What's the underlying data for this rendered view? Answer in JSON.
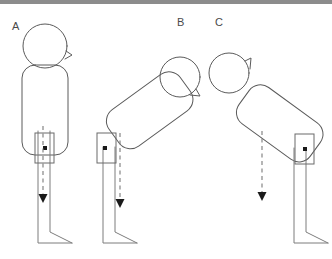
{
  "figure": {
    "background_color": "#ffffff",
    "top_bar_color": "#8c8c8c",
    "outline_color": "#5a5a5a",
    "limb_color": "#7d7d7d",
    "plumb_line_color": "#7a7a7a",
    "marker_color": "#1a1a1a",
    "width": 332,
    "height": 259
  },
  "panels": [
    {
      "id": "A",
      "label": "A",
      "label_x": 12,
      "label_y": 30,
      "description": "Upright standing posture, trunk vertical, plumb line passing through hip marker down to foot",
      "posture": "upright-standing",
      "trunk_angle_deg": 0,
      "plumb_line": {
        "x1": 43,
        "y1": 126,
        "x2": 43,
        "y2": 200
      },
      "arrow_direction": "down",
      "hip_marker": {
        "x": 45,
        "y": 148
      },
      "foot_direction": "right"
    },
    {
      "id": "B",
      "label": "B",
      "label_x": 177,
      "label_y": 26,
      "description": "Forward-flexed trunk leaning toward the right, hip marker left of plumb line",
      "posture": "trunk-flexed-right",
      "trunk_angle_deg": -35,
      "plumb_line": {
        "x1": 120,
        "y1": 133,
        "x2": 120,
        "y2": 205
      },
      "arrow_direction": "down",
      "hip_marker": {
        "x": 105,
        "y": 148
      },
      "foot_direction": "right"
    },
    {
      "id": "C",
      "label": "C",
      "label_x": 215,
      "label_y": 26,
      "description": "Forward-flexed trunk leaning toward the left, hip marker right of plumb line",
      "posture": "trunk-flexed-left",
      "trunk_angle_deg": 35,
      "plumb_line": {
        "x1": 262,
        "y1": 131,
        "x2": 262,
        "y2": 198
      },
      "arrow_direction": "down",
      "hip_marker": {
        "x": 305,
        "y": 149
      },
      "foot_direction": "right"
    }
  ],
  "icons": {
    "arrow_down": "arrow-down-icon",
    "joint_marker": "joint-marker-icon",
    "plumb_line": "plumb-line-icon"
  }
}
